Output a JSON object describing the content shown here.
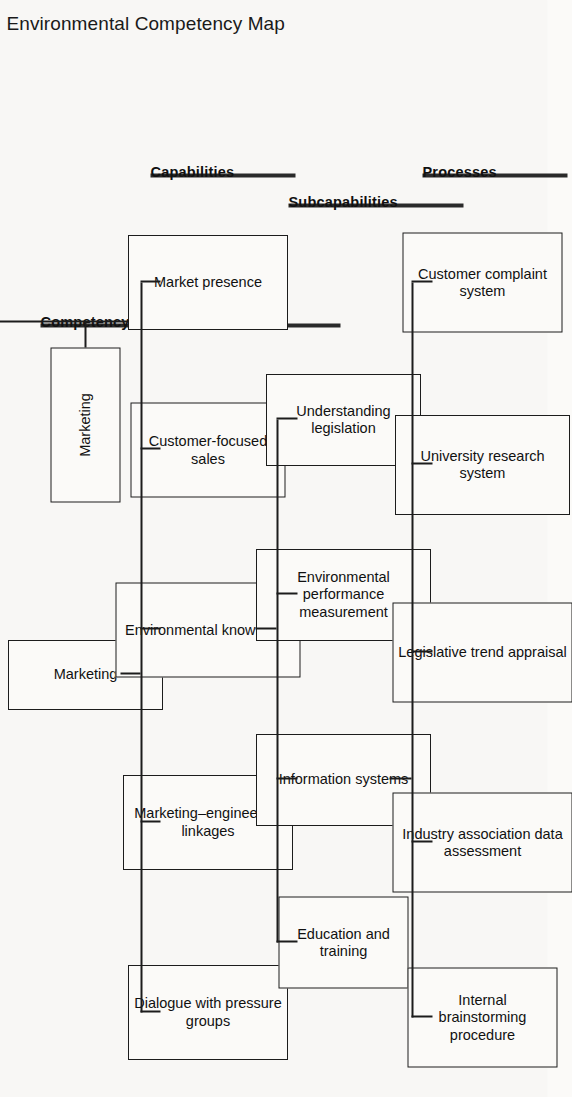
{
  "title": "Environmental Competency Map",
  "tiers": [
    {
      "id": "competency",
      "label": "Competency"
    },
    {
      "id": "capabilities",
      "label": "Capabilities"
    },
    {
      "id": "subcapabilities",
      "label": "Subcapabilities"
    },
    {
      "id": "processes",
      "label": "Processes"
    }
  ],
  "competency": {
    "nodes": [
      {
        "label": "Marketing"
      }
    ]
  },
  "capabilities": {
    "nodes": [
      {
        "label": "Market presence"
      },
      {
        "label": "Customer-focused sales"
      },
      {
        "label": "Environmental knowledge"
      },
      {
        "label": "Marketing–engineering linkages"
      },
      {
        "label": "Dialogue with pressure groups"
      }
    ]
  },
  "subcapabilities": {
    "nodes": [
      {
        "label": "Understanding legislation"
      },
      {
        "label": "Environmental performance measurement"
      },
      {
        "label": "Information systems"
      },
      {
        "label": "Education and training"
      }
    ]
  },
  "processes": {
    "nodes": [
      {
        "label": "Customer complaint system"
      },
      {
        "label": "University research system"
      },
      {
        "label": "Legislative trend appraisal"
      },
      {
        "label": "Industry association data assessment"
      },
      {
        "label": "Internal brainstorming procedure"
      }
    ]
  },
  "colors": {
    "background": "#f8f7f5",
    "box_border": "#1c1c1c",
    "box_fill": "#fbfaf8",
    "text": "#111111",
    "bar": "#2a2a2a",
    "connector": "#1c1c1c"
  }
}
